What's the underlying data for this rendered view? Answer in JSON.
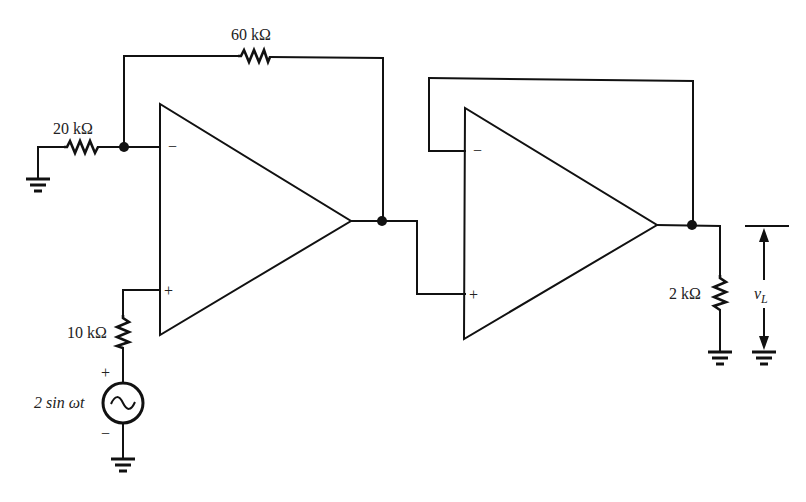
{
  "diagram": {
    "type": "circuit-schematic",
    "colors": {
      "line": "#111111",
      "text": "#222222",
      "background": "#ffffff"
    },
    "components": {
      "r_feedback": {
        "label": "60 kΩ"
      },
      "r_ground": {
        "label": "20 kΩ"
      },
      "r_input": {
        "label": "10 kΩ"
      },
      "r_load": {
        "label": "2 kΩ"
      },
      "source": {
        "label": "2 sin ωt",
        "plus": "+",
        "minus": "−"
      },
      "opamp1": {
        "inverting": "−",
        "noninverting": "+"
      },
      "opamp2": {
        "inverting": "−",
        "noninverting": "+"
      },
      "output_voltage": {
        "label": "v",
        "subscript": "L"
      }
    },
    "icons": [
      "resistor-icon",
      "ground-icon",
      "ac-source-icon",
      "opamp-icon",
      "junction-dot-icon",
      "voltage-arrow-icon"
    ]
  }
}
